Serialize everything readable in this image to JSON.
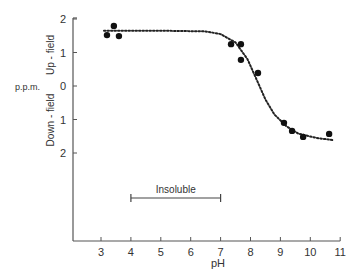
{
  "chart_data": {
    "type": "scatter",
    "title": "",
    "xlabel": "pH",
    "ylabel": "p.p.m.",
    "ylabel_up": "Up - field",
    "ylabel_down": "Down - field",
    "xlim": [
      2.0,
      11
    ],
    "ylim": [
      -2,
      2
    ],
    "x_ticks": [
      3,
      4,
      5,
      6,
      7,
      8,
      9,
      10,
      11
    ],
    "y_ticks": [
      2,
      1,
      0,
      -1,
      -2
    ],
    "y_tick_labels": [
      "2",
      "1",
      "0",
      "1",
      "2"
    ],
    "grid": false,
    "legend": null,
    "series": [
      {
        "name": "observed shift",
        "marker": "filled-circle",
        "points": [
          {
            "x": 3.2,
            "y": 1.52
          },
          {
            "x": 3.43,
            "y": 1.79
          },
          {
            "x": 3.6,
            "y": 1.49
          },
          {
            "x": 7.35,
            "y": 1.25
          },
          {
            "x": 7.68,
            "y": 1.25
          },
          {
            "x": 7.68,
            "y": 0.78
          },
          {
            "x": 8.25,
            "y": 0.39
          },
          {
            "x": 9.12,
            "y": -1.1
          },
          {
            "x": 9.39,
            "y": -1.34
          },
          {
            "x": 9.76,
            "y": -1.52
          },
          {
            "x": 10.63,
            "y": -1.43
          }
        ]
      },
      {
        "name": "fitted titration curve",
        "style": "dotted",
        "points": [
          {
            "x": 3.1,
            "y": 1.65
          },
          {
            "x": 5.0,
            "y": 1.65
          },
          {
            "x": 6.5,
            "y": 1.63
          },
          {
            "x": 7.0,
            "y": 1.55
          },
          {
            "x": 7.5,
            "y": 1.3
          },
          {
            "x": 7.9,
            "y": 0.8
          },
          {
            "x": 8.2,
            "y": 0.2
          },
          {
            "x": 8.5,
            "y": -0.4
          },
          {
            "x": 8.8,
            "y": -0.85
          },
          {
            "x": 9.2,
            "y": -1.2
          },
          {
            "x": 9.6,
            "y": -1.42
          },
          {
            "x": 10.2,
            "y": -1.55
          },
          {
            "x": 10.8,
            "y": -1.62
          }
        ]
      }
    ],
    "annotations": [
      {
        "text": "Insoluble",
        "type": "range-bar",
        "x_start": 4.0,
        "x_end": 7.0,
        "y": -3.3
      }
    ]
  }
}
